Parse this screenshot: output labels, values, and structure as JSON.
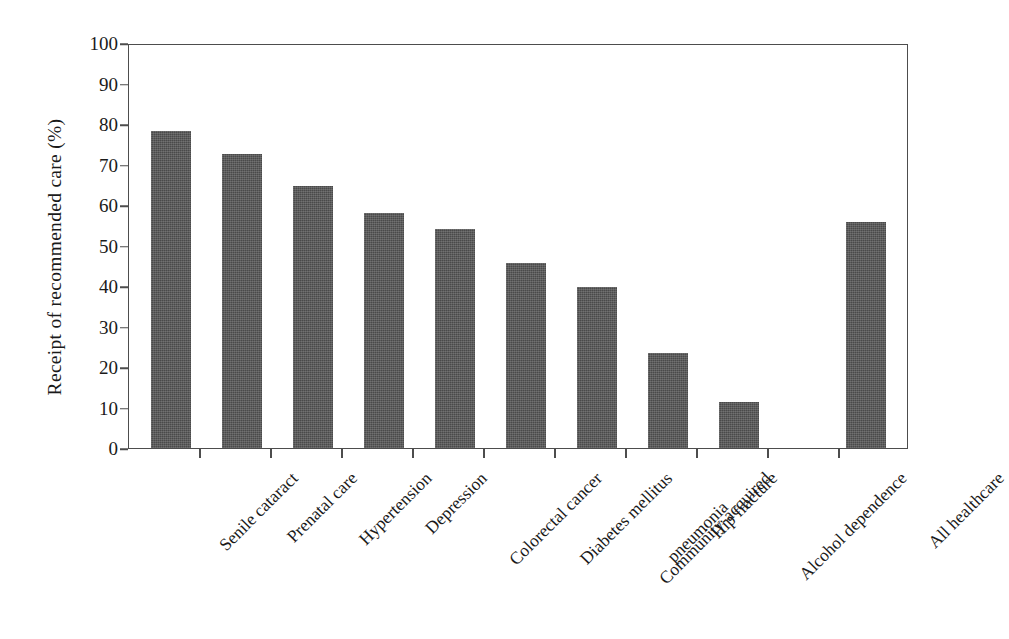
{
  "chart_data": {
    "type": "bar",
    "title": "",
    "subtitle": "",
    "xlabel": "",
    "ylabel": "Receipt of recommended care (%)",
    "ylim": [
      0,
      100
    ],
    "ytick_labels": [
      "0",
      "10",
      "20",
      "30",
      "40",
      "50",
      "60",
      "70",
      "80",
      "90",
      "100"
    ],
    "ytick_values": [
      0,
      10,
      20,
      30,
      40,
      50,
      60,
      70,
      80,
      90,
      100
    ],
    "grid": false,
    "legend": null,
    "bar_color": "#4a4a4a",
    "axis_color": "#4d4d4d",
    "background_color": "#ffffff",
    "categories": [
      "Senile cataract",
      "Prenatal care",
      "Hypertension",
      "Depression",
      "Colorectal cancer",
      "Diabetes mellitus",
      "Community-acquired pneumonia",
      "Hip fracture",
      "Alcohol dependence",
      "",
      "All healthcare"
    ],
    "values": [
      78.7,
      73.0,
      65.0,
      58.3,
      54.3,
      45.9,
      39.9,
      23.7,
      11.5,
      null,
      56.1
    ],
    "category_labels_display": [
      "Senile cataract",
      "Prenatal care",
      "Hypertension",
      "Depression",
      "Colorectal cancer",
      "Diabetes mellitus",
      "Community-acquired",
      "pneumonia",
      "Hip fracture",
      "Alcohol dependence",
      "All healthcare"
    ]
  },
  "axes": {
    "y_title": "Receipt of recommended care (%)",
    "ticks": {
      "t0": "0",
      "t10": "10",
      "t20": "20",
      "t30": "30",
      "t40": "40",
      "t50": "50",
      "t60": "60",
      "t70": "70",
      "t80": "80",
      "t90": "90",
      "t100": "100"
    }
  },
  "xlabels": {
    "l0": "Senile cataract",
    "l1": "Prenatal care",
    "l2": "Hypertension",
    "l3": "Depression",
    "l4": "Colorectal cancer",
    "l5": "Diabetes mellitus",
    "l6a": "Community-acquired",
    "l6b": "pneumonia",
    "l7": "Hip fracture",
    "l8": "Alcohol dependence",
    "l10": "All healthcare"
  }
}
